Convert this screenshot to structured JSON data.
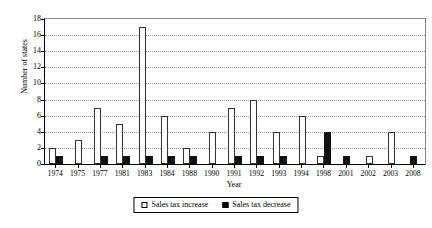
{
  "chart_data": {
    "type": "bar",
    "title": "",
    "xlabel": "Year",
    "ylabel": "Number of states",
    "ylim": [
      0,
      18
    ],
    "yticks": [
      0,
      2,
      4,
      6,
      8,
      10,
      12,
      14,
      16,
      18
    ],
    "grid": true,
    "legend_position": "bottom",
    "categories": [
      "1974",
      "1975",
      "1977",
      "1981",
      "1983",
      "1984",
      "1988",
      "1990",
      "1991",
      "1992",
      "1993",
      "1994",
      "1998",
      "2001",
      "2002",
      "2003",
      "2008"
    ],
    "series": [
      {
        "name": "Sales tax increase",
        "color": "#ffffff",
        "values": [
          2,
          3,
          7,
          5,
          17,
          6,
          2,
          4,
          7,
          8,
          4,
          6,
          1,
          0,
          1,
          4,
          0
        ]
      },
      {
        "name": "Sales tax decrease",
        "color": "#000000",
        "values": [
          1,
          0,
          1,
          1,
          1,
          1,
          1,
          0,
          1,
          1,
          1,
          0,
          4,
          1,
          0,
          0,
          1
        ]
      }
    ]
  },
  "legend": {
    "items": [
      {
        "label": "Sales tax increase",
        "swatch": "white-square-icon"
      },
      {
        "label": "Sales tax decrease",
        "swatch": "black-square-icon"
      }
    ]
  }
}
